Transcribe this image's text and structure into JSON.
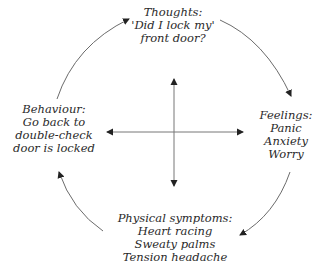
{
  "diagram": {
    "type": "cycle",
    "title": "",
    "center": "four-way cross arrows",
    "colors": {
      "line": "#6b6b6b",
      "arrowhead": "#222222",
      "text": "#2a2a2a",
      "background": "#ffffff"
    },
    "nodes": {
      "thoughts": {
        "heading": "Thoughts:",
        "lines": [
          "'Did I lock my'",
          "front door?"
        ]
      },
      "feelings": {
        "heading": "Feelings:",
        "lines": [
          "Panic",
          "Anxiety",
          "Worry"
        ]
      },
      "physical": {
        "heading": "Physical symptoms:",
        "lines": [
          "Heart racing",
          "Sweaty palms",
          "Tension headache"
        ]
      },
      "behaviour": {
        "heading": "Behaviour:",
        "lines": [
          "Go back to",
          "double-check",
          "door is locked"
        ]
      }
    },
    "edges": [
      {
        "from": "thoughts",
        "to": "feelings"
      },
      {
        "from": "feelings",
        "to": "physical"
      },
      {
        "from": "physical",
        "to": "behaviour"
      },
      {
        "from": "behaviour",
        "to": "thoughts"
      }
    ]
  }
}
